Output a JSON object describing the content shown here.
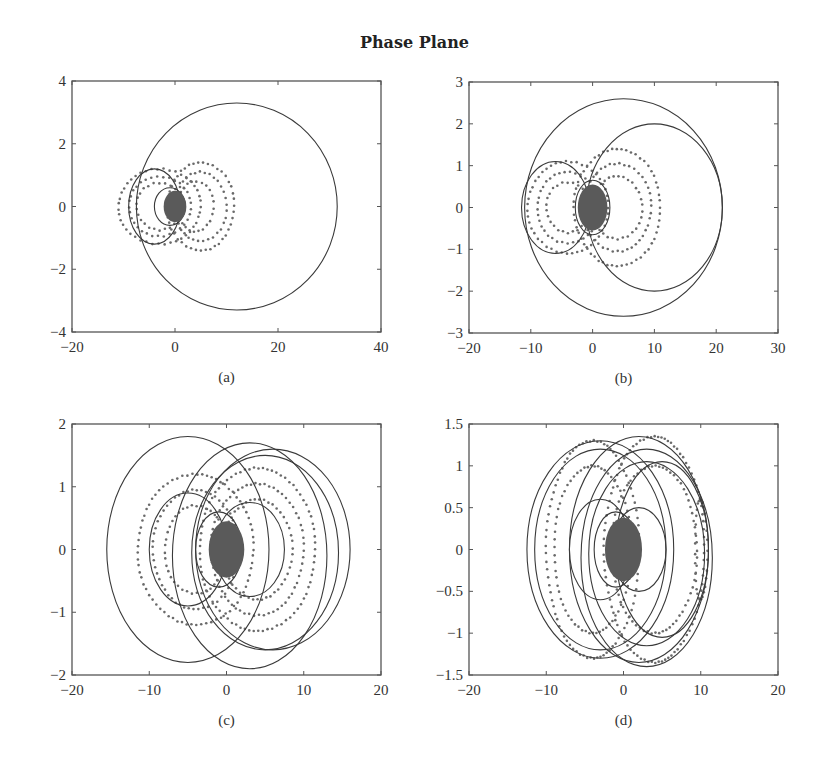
{
  "figure": {
    "title": "Phase Plane"
  },
  "colors": {
    "axis": "#555555",
    "curve": "#3a3a3a",
    "dots": "#6a6a6a",
    "core": "#5a5a5a"
  },
  "chart_data": [
    {
      "type": "scatter",
      "panel": "(a)",
      "title": "",
      "xlabel": "",
      "ylabel": "",
      "xlim": [
        -20,
        40
      ],
      "ylim": [
        -4,
        4
      ],
      "xticks": [
        -20,
        0,
        20,
        40
      ],
      "yticks": [
        -4,
        -2,
        0,
        2,
        4
      ],
      "grid": false,
      "box_px": [
        72,
        81,
        381,
        332
      ],
      "curves": [
        {
          "kind": "ellipse",
          "cx": 12,
          "cy": 0,
          "rx": 19.5,
          "ry": 3.3
        },
        {
          "kind": "ellipse",
          "cx": -4,
          "cy": 0,
          "rx": 5,
          "ry": 1.2
        },
        {
          "kind": "ellipse",
          "cx": -1,
          "cy": 0,
          "rx": 3,
          "ry": 0.6
        }
      ],
      "dot_rings": [
        {
          "cx": -3,
          "cy": 0,
          "rx": 8,
          "ry": 1.2
        },
        {
          "cx": -3,
          "cy": 0,
          "rx": 6,
          "ry": 0.95
        },
        {
          "cx": -3,
          "cy": 0,
          "rx": 4.5,
          "ry": 0.75
        },
        {
          "cx": 5,
          "cy": 0,
          "rx": 6.5,
          "ry": 1.4
        },
        {
          "cx": 5,
          "cy": 0,
          "rx": 5,
          "ry": 1.1
        },
        {
          "cx": 4,
          "cy": 0,
          "rx": 3.5,
          "ry": 0.8
        }
      ],
      "core": {
        "cx": 0,
        "cy": 0,
        "rx": 2.2,
        "ry": 0.5
      }
    },
    {
      "type": "scatter",
      "panel": "(b)",
      "title": "",
      "xlabel": "",
      "ylabel": "",
      "xlim": [
        -20,
        30
      ],
      "ylim": [
        -3,
        3
      ],
      "xticks": [
        -20,
        -10,
        0,
        10,
        20,
        30
      ],
      "yticks": [
        -3,
        -2,
        -1,
        0,
        1,
        2,
        3
      ],
      "grid": false,
      "box_px": [
        469,
        82,
        778,
        333
      ],
      "curves": [
        {
          "kind": "ellipse",
          "cx": 5,
          "cy": 0,
          "rx": 16,
          "ry": 2.6
        },
        {
          "kind": "ellipse",
          "cx": 10,
          "cy": 0,
          "rx": 11,
          "ry": 2.0
        },
        {
          "kind": "ellipse",
          "cx": -6,
          "cy": 0,
          "rx": 5.5,
          "ry": 1.1
        },
        {
          "kind": "ellipse",
          "cx": 0,
          "cy": 0,
          "rx": 2.8,
          "ry": 0.65
        }
      ],
      "dot_rings": [
        {
          "cx": -4,
          "cy": 0,
          "rx": 6.5,
          "ry": 1.1
        },
        {
          "cx": -4,
          "cy": 0,
          "rx": 5,
          "ry": 0.85
        },
        {
          "cx": -4,
          "cy": 0,
          "rx": 3.5,
          "ry": 0.6
        },
        {
          "cx": 4,
          "cy": 0,
          "rx": 7,
          "ry": 1.4
        },
        {
          "cx": 4,
          "cy": 0,
          "rx": 5.5,
          "ry": 1.05
        },
        {
          "cx": 4,
          "cy": 0,
          "rx": 4,
          "ry": 0.75
        }
      ],
      "core": {
        "cx": 0,
        "cy": 0,
        "rx": 2.4,
        "ry": 0.55
      }
    },
    {
      "type": "scatter",
      "panel": "(c)",
      "title": "",
      "xlabel": "",
      "ylabel": "",
      "xlim": [
        -20,
        20
      ],
      "ylim": [
        -2,
        2
      ],
      "xticks": [
        -20,
        -10,
        0,
        10,
        20
      ],
      "yticks": [
        -2,
        -1,
        0,
        1,
        2
      ],
      "grid": false,
      "box_px": [
        72,
        424,
        381,
        675
      ],
      "curves": [
        {
          "kind": "ellipse",
          "cx": -5,
          "cy": 0,
          "rx": 10.5,
          "ry": 1.8
        },
        {
          "kind": "ellipse",
          "cx": 6,
          "cy": 0,
          "rx": 10,
          "ry": 1.6
        },
        {
          "kind": "ellipse",
          "cx": 5,
          "cy": -0.05,
          "rx": 9.5,
          "ry": 1.55
        },
        {
          "kind": "ellipse",
          "cx": 3,
          "cy": -0.1,
          "rx": 10,
          "ry": 1.8
        },
        {
          "kind": "ellipse",
          "cx": -5,
          "cy": 0,
          "rx": 5,
          "ry": 0.9
        },
        {
          "kind": "ellipse",
          "cx": 3,
          "cy": 0,
          "rx": 4.5,
          "ry": 0.75
        },
        {
          "kind": "ellipse",
          "cx": -1,
          "cy": 0,
          "rx": 3,
          "ry": 0.6
        }
      ],
      "dot_rings": [
        {
          "cx": -4,
          "cy": 0,
          "rx": 7.5,
          "ry": 1.2
        },
        {
          "cx": -4,
          "cy": 0,
          "rx": 5.5,
          "ry": 0.95
        },
        {
          "cx": -4,
          "cy": 0,
          "rx": 4,
          "ry": 0.7
        },
        {
          "cx": 4,
          "cy": 0,
          "rx": 7.5,
          "ry": 1.3
        },
        {
          "cx": 4,
          "cy": 0,
          "rx": 6,
          "ry": 1.05
        },
        {
          "cx": 4,
          "cy": 0,
          "rx": 4.5,
          "ry": 0.8
        }
      ],
      "core": {
        "cx": 0,
        "cy": 0,
        "rx": 2.3,
        "ry": 0.45
      }
    },
    {
      "type": "scatter",
      "panel": "(d)",
      "title": "",
      "xlabel": "",
      "ylabel": "",
      "xlim": [
        -20,
        20
      ],
      "ylim": [
        -1.5,
        1.5
      ],
      "xticks": [
        -20,
        -10,
        0,
        10,
        20
      ],
      "yticks": [
        -1.5,
        -1,
        -0.5,
        0,
        0.5,
        1,
        1.5
      ],
      "grid": false,
      "box_px": [
        469,
        424,
        778,
        675
      ],
      "curves": [
        {
          "kind": "ellipse",
          "cx": -3,
          "cy": 0,
          "rx": 9.5,
          "ry": 1.3
        },
        {
          "kind": "ellipse",
          "cx": -3,
          "cy": 0,
          "rx": 8.5,
          "ry": 1.2
        },
        {
          "kind": "ellipse",
          "cx": 3,
          "cy": -0.1,
          "rx": 8.5,
          "ry": 1.3
        },
        {
          "kind": "ellipse",
          "cx": 3,
          "cy": -0.05,
          "rx": 7.5,
          "ry": 1.1
        },
        {
          "kind": "ellipse",
          "cx": 2,
          "cy": 0,
          "rx": 9,
          "ry": 1.35
        },
        {
          "kind": "ellipse",
          "cx": 5,
          "cy": 0,
          "rx": 6,
          "ry": 1.05
        },
        {
          "kind": "ellipse",
          "cx": -3,
          "cy": 0,
          "rx": 4,
          "ry": 0.6
        },
        {
          "kind": "ellipse",
          "cx": 2,
          "cy": 0,
          "rx": 3.5,
          "ry": 0.5
        },
        {
          "kind": "ellipse",
          "cx": -1,
          "cy": 0,
          "rx": 2.8,
          "ry": 0.45
        }
      ],
      "dot_rings": [
        {
          "cx": -4,
          "cy": 0,
          "rx": 6,
          "ry": 1.3
        },
        {
          "cx": -4,
          "cy": 0,
          "rx": 5,
          "ry": 1.0
        },
        {
          "cx": 4,
          "cy": 0,
          "rx": 6.5,
          "ry": 1.35
        },
        {
          "cx": 4,
          "cy": 0,
          "rx": 5.5,
          "ry": 1.0
        },
        {
          "cx": 10,
          "cy": 0,
          "rx": 0.8,
          "ry": 0.6
        }
      ],
      "core": {
        "cx": 0,
        "cy": 0,
        "rx": 2.4,
        "ry": 0.38
      }
    }
  ]
}
